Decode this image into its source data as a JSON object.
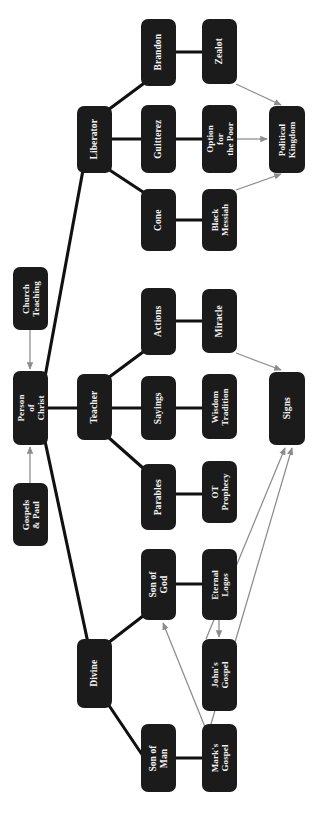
{
  "diagram": {
    "title": "Person of Christ",
    "type": "concept-map",
    "orientation": "rotated-90-ccw",
    "colors": {
      "node_fill": "#1b1b1b",
      "node_text": "#f2f2f2",
      "thick_edge": "#111111",
      "thin_arrow": "#8c8c8c",
      "background": "#ffffff"
    },
    "nodes": [
      {
        "id": "brandon",
        "label": "Brandon",
        "x": 141,
        "y": 19,
        "w": 35,
        "h": 67
      },
      {
        "id": "zealot",
        "label": "Zealot",
        "x": 202,
        "y": 19,
        "w": 35,
        "h": 65
      },
      {
        "id": "liberator",
        "label": "Liberator",
        "x": 77,
        "y": 106,
        "w": 35,
        "h": 67
      },
      {
        "id": "guitterez",
        "label": "Guitterez",
        "x": 141,
        "y": 105,
        "w": 35,
        "h": 68
      },
      {
        "id": "option-poor",
        "label": "Option for\nthe Poor",
        "x": 202,
        "y": 105,
        "w": 35,
        "h": 68
      },
      {
        "id": "political-kingdom",
        "label": "Political\nKingdom",
        "x": 269,
        "y": 106,
        "w": 36,
        "h": 67
      },
      {
        "id": "cone",
        "label": "Cone",
        "x": 141,
        "y": 189,
        "w": 35,
        "h": 62
      },
      {
        "id": "black-messiah",
        "label": "Black\nMessiah",
        "x": 202,
        "y": 189,
        "w": 35,
        "h": 62
      },
      {
        "id": "church-teaching",
        "label": "Church\nTeaching",
        "x": 13,
        "y": 267,
        "w": 35,
        "h": 63
      },
      {
        "id": "actions",
        "label": "Actions",
        "x": 141,
        "y": 288,
        "w": 35,
        "h": 67
      },
      {
        "id": "miracle",
        "label": "Miracle",
        "x": 202,
        "y": 289,
        "w": 35,
        "h": 64
      },
      {
        "id": "person-of-christ",
        "label": "Person\nof Christ",
        "x": 13,
        "y": 371,
        "w": 35,
        "h": 74
      },
      {
        "id": "teacher",
        "label": "Teacher",
        "x": 77,
        "y": 374,
        "w": 35,
        "h": 66
      },
      {
        "id": "sayings",
        "label": "Sayings",
        "x": 141,
        "y": 376,
        "w": 35,
        "h": 64
      },
      {
        "id": "wisdom-tradition",
        "label": "Wisdom\nTradition",
        "x": 202,
        "y": 374,
        "w": 35,
        "h": 65
      },
      {
        "id": "signs",
        "label": "Signs",
        "x": 269,
        "y": 372,
        "w": 36,
        "h": 73
      },
      {
        "id": "gospels-paul",
        "label": "Gospels\n& Paul",
        "x": 13,
        "y": 483,
        "w": 35,
        "h": 63
      },
      {
        "id": "parables",
        "label": "Parables",
        "x": 141,
        "y": 464,
        "w": 35,
        "h": 66
      },
      {
        "id": "ot-prophecy",
        "label": "OT\nProphecy",
        "x": 202,
        "y": 461,
        "w": 35,
        "h": 62
      },
      {
        "id": "son-of-god",
        "label": "Son of God",
        "x": 141,
        "y": 549,
        "w": 35,
        "h": 71
      },
      {
        "id": "eternal-logos",
        "label": "Eternal\nLogos",
        "x": 202,
        "y": 549,
        "w": 35,
        "h": 71
      },
      {
        "id": "divine",
        "label": "Divine",
        "x": 77,
        "y": 639,
        "w": 35,
        "h": 69
      },
      {
        "id": "johns-gospel",
        "label": "John's\nGospel",
        "x": 202,
        "y": 639,
        "w": 35,
        "h": 72
      },
      {
        "id": "son-of-man",
        "label": "Son of Man",
        "x": 141,
        "y": 724,
        "w": 35,
        "h": 68
      },
      {
        "id": "marks-gospel",
        "label": "Mark's\nGospel",
        "x": 202,
        "y": 724,
        "w": 35,
        "h": 68
      }
    ],
    "thick_edges": [
      {
        "from": "person-of-christ",
        "to": "liberator",
        "d": "M 45,377 L 83,170"
      },
      {
        "from": "person-of-christ",
        "to": "teacher",
        "d": "M 48,408 L 77,408"
      },
      {
        "from": "person-of-christ",
        "to": "divine",
        "d": "M 45,441 L 88,643"
      },
      {
        "from": "liberator",
        "to": "brandon",
        "d": "M 108,110 L 143,84"
      },
      {
        "from": "liberator",
        "to": "guitterez",
        "d": "M 112,139 L 141,139"
      },
      {
        "from": "liberator",
        "to": "cone",
        "d": "M 108,169 L 143,192"
      },
      {
        "from": "brandon",
        "to": "zealot",
        "d": "M 176,52 L 202,52"
      },
      {
        "from": "guitterez",
        "to": "option-poor",
        "d": "M 176,139 L 202,139"
      },
      {
        "from": "cone",
        "to": "black-messiah",
        "d": "M 176,220 L 202,220"
      },
      {
        "from": "teacher",
        "to": "actions",
        "d": "M 108,378 L 143,352"
      },
      {
        "from": "teacher",
        "to": "sayings",
        "d": "M 112,408 L 141,408"
      },
      {
        "from": "teacher",
        "to": "parables",
        "d": "M 108,437 L 143,468"
      },
      {
        "from": "actions",
        "to": "miracle",
        "d": "M 176,321 L 202,321"
      },
      {
        "from": "sayings",
        "to": "wisdom-tradition",
        "d": "M 176,408 L 202,408"
      },
      {
        "from": "parables",
        "to": "ot-prophecy",
        "d": "M 176,494 L 202,494"
      },
      {
        "from": "divine",
        "to": "son-of-god",
        "d": "M 108,643 L 143,616"
      },
      {
        "from": "divine",
        "to": "son-of-man",
        "d": "M 108,704 L 143,756"
      },
      {
        "from": "son-of-god",
        "to": "eternal-logos",
        "d": "M 176,584 L 202,584"
      },
      {
        "from": "son-of-man",
        "to": "marks-gospel",
        "d": "M 176,758 L 202,758"
      }
    ],
    "thin_arrows": [
      {
        "from": "church-teaching",
        "to": "person-of-christ",
        "d": "M 30,330 L 30,369"
      },
      {
        "from": "gospels-paul",
        "to": "person-of-christ",
        "d": "M 30,483 L 30,447"
      },
      {
        "from": "zealot",
        "to": "political-kingdom",
        "d": "M 236,84 L 281,105"
      },
      {
        "from": "option-poor",
        "to": "political-kingdom",
        "d": "M 237,139 L 267,139"
      },
      {
        "from": "black-messiah",
        "to": "political-kingdom",
        "d": "M 236,190 L 281,174"
      },
      {
        "from": "miracle",
        "to": "signs",
        "d": "M 236,353 L 281,370"
      },
      {
        "from": "eternal-logos",
        "to": "johns-gospel",
        "d": "M 219,620 L 219,637"
      },
      {
        "from": "marks-gospel",
        "to": "son-of-god",
        "d": "M 205,727 L 163,623"
      },
      {
        "from": "johns-gospel",
        "to": "signs",
        "d": "M 206,639 L 285,448"
      },
      {
        "from": "marks-gospel",
        "to": "signs",
        "d": "M 211,724 L 292,448"
      }
    ]
  }
}
